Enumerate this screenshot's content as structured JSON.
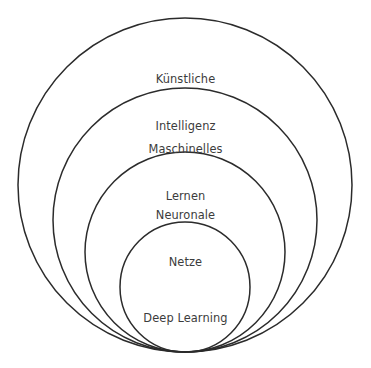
{
  "diagram": {
    "type": "nested-circles",
    "background_color": "#ffffff",
    "stroke_color": "#2b2b2b",
    "text_color": "#3c3c3c",
    "canvas": {
      "width": 371,
      "height": 368
    },
    "tangent_point": {
      "x": 185,
      "y": 352
    },
    "levels": [
      {
        "id": "kuenstliche-intelligenz",
        "label_line1": "Künstliche",
        "label_line2": "Intelligenz",
        "cx": 185,
        "cy": 185,
        "r": 167,
        "label_top": 41
      },
      {
        "id": "maschinelles-lernen",
        "label_line1": "Maschinelles",
        "label_line2": "Lernen",
        "cx": 185,
        "cy": 220,
        "r": 132,
        "label_top": 111
      },
      {
        "id": "neuronale-netze",
        "label_line1": "Neuronale",
        "label_line2": "Netze",
        "cx": 185,
        "cy": 252,
        "r": 100,
        "label_top": 177
      },
      {
        "id": "deep-learning",
        "label_line1": "Deep Learning",
        "label_line2": "",
        "cx": 185,
        "cy": 287,
        "r": 65,
        "label_top": 280
      }
    ]
  }
}
